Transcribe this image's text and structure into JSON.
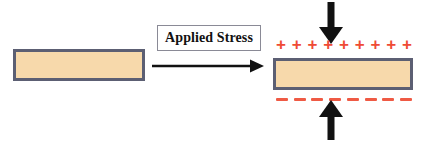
{
  "figure": {
    "colors": {
      "material_fill": "#f7d9ab",
      "material_border": "#5c5f73",
      "positive_charge": "#ef4b35",
      "negative_charge": "#ef5a44",
      "arrow": "#111111",
      "label_border": "#8a8a96",
      "background": "#ffffff"
    }
  },
  "unstressed_block": {
    "name": "Unstressed material block",
    "fill": "#f7d9ab",
    "border": "#5c5f73"
  },
  "stress_label": {
    "text": "Applied Stress"
  },
  "arrows": {
    "applied_stress": "right-arrow",
    "compression_top": "down-arrow",
    "compression_bottom": "up-arrow"
  },
  "stressed_block": {
    "name": "Stressed polarized material block",
    "fill": "#f7d9ab",
    "border": "#5c5f73"
  },
  "charges": {
    "positive": {
      "symbol": "+",
      "count": 9,
      "color": "#ef4b35",
      "position": "top-surface"
    },
    "negative": {
      "symbol": "-",
      "count": 8,
      "color": "#ef5a44",
      "position": "bottom-surface"
    }
  }
}
